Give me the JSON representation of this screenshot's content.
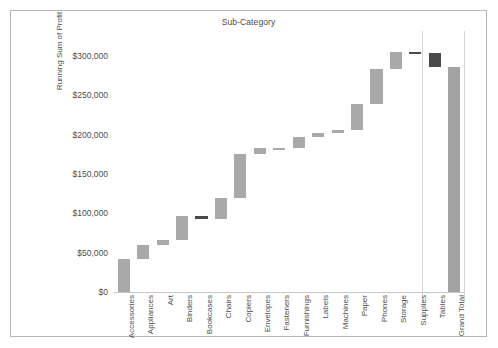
{
  "chart_data": {
    "type": "bar",
    "subtype": "waterfall",
    "title": "Sub-Category",
    "xlabel": "Sub-Category",
    "ylabel": "Running Sum of Profit",
    "ylim": [
      0,
      310000
    ],
    "y_ticks": [
      "$0",
      "$50,000",
      "$100,000",
      "$150,000",
      "$200,000",
      "$250,000",
      "$300,000"
    ],
    "y_tick_values": [
      0,
      50000,
      100000,
      150000,
      200000,
      250000,
      300000
    ],
    "grid": false,
    "legend": "none",
    "categories": [
      "Accessories",
      "Appliances",
      "Art",
      "Binders",
      "Bookcases",
      "Chairs",
      "Copiers",
      "Envelopes",
      "Fasteners",
      "Furnishings",
      "Labels",
      "Machines",
      "Paper",
      "Phones",
      "Storage",
      "Supplies",
      "Tables",
      "Grand Total"
    ],
    "deltas": [
      41937,
      18138,
      6528,
      30222,
      -3473,
      26590,
      55618,
      6964,
      950,
      13059,
      5546,
      3385,
      34054,
      44516,
      21279,
      -1189,
      -17725,
      0
    ],
    "cumulative": [
      41937,
      60075,
      66603,
      96825,
      93352,
      119942,
      175560,
      182524,
      183474,
      196533,
      202079,
      205464,
      239518,
      284034,
      305313,
      304124,
      286399,
      286399
    ],
    "bars": [
      {
        "label": "Accessories",
        "start": 0,
        "end": 41937,
        "value": 41937,
        "sign": "positive"
      },
      {
        "label": "Appliances",
        "start": 41937,
        "end": 60075,
        "value": 18138,
        "sign": "positive"
      },
      {
        "label": "Art",
        "start": 60075,
        "end": 66603,
        "value": 6528,
        "sign": "positive"
      },
      {
        "label": "Binders",
        "start": 66603,
        "end": 96825,
        "value": 30222,
        "sign": "positive"
      },
      {
        "label": "Bookcases",
        "start": 96825,
        "end": 93352,
        "value": -3473,
        "sign": "negative"
      },
      {
        "label": "Chairs",
        "start": 93352,
        "end": 119942,
        "value": 26590,
        "sign": "positive"
      },
      {
        "label": "Copiers",
        "start": 119942,
        "end": 175560,
        "value": 55618,
        "sign": "positive"
      },
      {
        "label": "Envelopes",
        "start": 175560,
        "end": 182524,
        "value": 6964,
        "sign": "positive"
      },
      {
        "label": "Fasteners",
        "start": 182524,
        "end": 183474,
        "value": 950,
        "sign": "positive"
      },
      {
        "label": "Furnishings",
        "start": 183474,
        "end": 196533,
        "value": 13059,
        "sign": "positive"
      },
      {
        "label": "Labels",
        "start": 196533,
        "end": 202079,
        "value": 5546,
        "sign": "positive"
      },
      {
        "label": "Machines",
        "start": 202079,
        "end": 205464,
        "value": 3385,
        "sign": "positive"
      },
      {
        "label": "Paper",
        "start": 205464,
        "end": 239518,
        "value": 34054,
        "sign": "positive"
      },
      {
        "label": "Phones",
        "start": 239518,
        "end": 284034,
        "value": 44516,
        "sign": "positive"
      },
      {
        "label": "Storage",
        "start": 284034,
        "end": 305313,
        "value": 21279,
        "sign": "positive"
      },
      {
        "label": "Supplies",
        "start": 305313,
        "end": 304124,
        "value": -1189,
        "sign": "negative"
      },
      {
        "label": "Tables",
        "start": 304124,
        "end": 286399,
        "value": -17725,
        "sign": "negative"
      },
      {
        "label": "Grand Total",
        "start": 0,
        "end": 286399,
        "value": 286399,
        "sign": "total"
      }
    ],
    "colors": {
      "positive_bar": "#a9a9a9",
      "negative_bar": "#4a4a4a",
      "total_bar": "#a3a3a3",
      "axis": "#c8c8c8",
      "text": "#4d4d4d",
      "frame": "#b6b6b6",
      "background": "#ffffff"
    }
  }
}
